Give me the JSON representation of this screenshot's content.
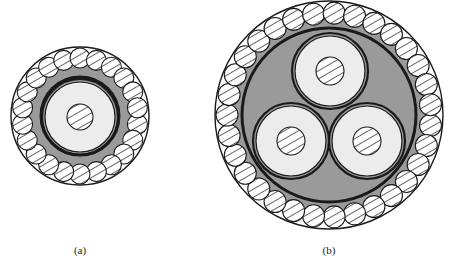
{
  "figure": {
    "panels": [
      {
        "id": "a",
        "label": "(a)",
        "description": "Single-core armoured cable cross-section",
        "center": [
          80,
          116
        ],
        "outer_radius": 69,
        "armor_ring_radius": 58,
        "armor_wire_radius": 10,
        "armor_wire_count": 22,
        "inner_jacket_radius": 39,
        "conductors": [
          {
            "center": [
              80,
              117
            ],
            "insulation_radius": 35,
            "core_radius": 13
          }
        ],
        "label_position": [
          80,
          251
        ]
      },
      {
        "id": "b",
        "label": "(b)",
        "description": "Three-core armoured cable cross-section",
        "center": [
          329,
          115
        ],
        "outer_radius": 114,
        "armor_ring_radius": 102,
        "armor_wire_radius": 11,
        "armor_wire_count": 31,
        "inner_jacket_radius": 87,
        "conductors": [
          {
            "center": [
              330,
              71
            ],
            "insulation_radius": 35,
            "core_radius": 14
          },
          {
            "center": [
              291,
              141
            ],
            "insulation_radius": 35,
            "core_radius": 14
          },
          {
            "center": [
              367,
              141
            ],
            "insulation_radius": 35,
            "core_radius": 14
          }
        ],
        "label_position": [
          329,
          251
        ]
      }
    ],
    "colors": {
      "background": "#ffffff",
      "outline": "#1a1a1a",
      "bedding_fill": "#9a9a9a",
      "insulation_fill": "#ececec",
      "armor_fill": "#ffffff",
      "hatch": "#555555"
    }
  }
}
